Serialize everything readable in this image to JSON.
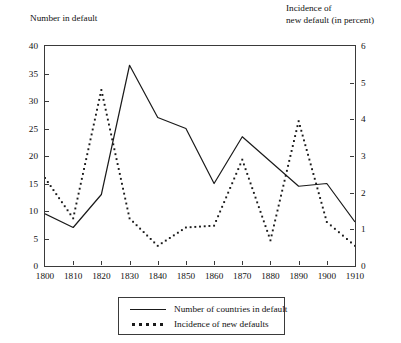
{
  "titles": {
    "left_axis": "Number in default",
    "right_axis": "Incidence of\nnew default (in percent)"
  },
  "legend": {
    "solid_label": "Number of countries in default",
    "dotted_label": "Incidence of new defaults"
  },
  "chart_data": {
    "type": "line",
    "title": "",
    "subtitle": "",
    "xlabel": "",
    "ylabel": "Number in default",
    "y2label": "Incidence of new default (in percent)",
    "grid": false,
    "legend_position": "bottom-center",
    "x": [
      1800,
      1810,
      1820,
      1830,
      1840,
      1850,
      1860,
      1870,
      1880,
      1890,
      1900,
      1910
    ],
    "xlim": [
      1800,
      1910
    ],
    "xticks": [
      "1800",
      "1810",
      "1820",
      "1830",
      "1840",
      "1850",
      "1860",
      "1870",
      "1880",
      "1890",
      "1900",
      "1910"
    ],
    "ylim": [
      0,
      40
    ],
    "yticks": [
      "0",
      "5",
      "10",
      "15",
      "20",
      "25",
      "30",
      "35",
      "40"
    ],
    "y2lim": [
      0,
      6
    ],
    "y2ticks": [
      "0",
      "1",
      "2",
      "3",
      "4",
      "5",
      "6"
    ],
    "series": [
      {
        "name": "Number of countries in default",
        "style": "solid",
        "axis": "left",
        "color": "#1a1a1a",
        "values": [
          9.5,
          7.0,
          13.0,
          36.5,
          27.0,
          25.0,
          15.0,
          23.5,
          19.0,
          14.5,
          15.0,
          8.0
        ]
      },
      {
        "name": "Incidence of new defaults",
        "style": "dotted",
        "axis": "right",
        "color": "#1a1a1a",
        "values": [
          2.4,
          1.3,
          4.8,
          1.3,
          0.55,
          1.05,
          1.1,
          2.9,
          0.7,
          3.95,
          1.2,
          0.55
        ]
      }
    ]
  }
}
